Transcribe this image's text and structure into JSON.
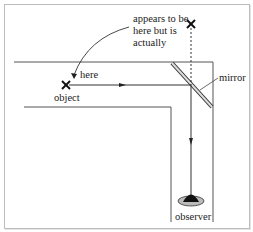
{
  "diagram": {
    "labels": {
      "appears": [
        "appears to be",
        "here but is",
        "actually"
      ],
      "here": "here",
      "object": "object",
      "mirror": "mirror",
      "observer": "observer"
    },
    "colors": {
      "line": "#333333",
      "wall": "#555555",
      "mirror_fill": "#dddddd",
      "frame": "#bdbdbd"
    },
    "markers": {
      "object_cross": "x-mark",
      "virtual_image_cross": "x-mark"
    }
  }
}
